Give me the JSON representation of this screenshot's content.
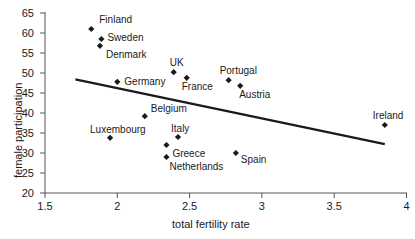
{
  "chart_data": {
    "type": "scatter",
    "title": "",
    "xlabel": "total fertility rate",
    "ylabel": "female participation",
    "xlim": [
      1.5,
      4
    ],
    "ylim": [
      20,
      65
    ],
    "xticks": [
      "1.5",
      "2",
      "2.5",
      "3",
      "3.5",
      "4"
    ],
    "xtick_values": [
      1.5,
      2,
      2.5,
      3,
      3.5,
      4
    ],
    "yticks": [
      "20",
      "25",
      "30",
      "35",
      "40",
      "45",
      "50",
      "55",
      "60",
      "65"
    ],
    "ytick_values": [
      20,
      25,
      30,
      35,
      40,
      45,
      50,
      55,
      60,
      65
    ],
    "grid": false,
    "legend": "none",
    "marker": "diamond",
    "marker_color": "#1a1a1a",
    "line_color": "#1a1a1a",
    "points": [
      {
        "label": "Finland",
        "x": 1.82,
        "y": 61.0,
        "label_dx": 8,
        "label_dy": -14
      },
      {
        "label": "Sweden",
        "x": 1.89,
        "y": 58.5,
        "label_dx": 6,
        "label_dy": -6
      },
      {
        "label": "Denmark",
        "x": 1.88,
        "y": 56.8,
        "label_dx": 6,
        "label_dy": 4
      },
      {
        "label": "UK",
        "x": 2.39,
        "y": 50.2,
        "label_dx": -4,
        "label_dy": -14
      },
      {
        "label": "Germany",
        "x": 2.0,
        "y": 47.8,
        "label_dx": 7,
        "label_dy": -5
      },
      {
        "label": "France",
        "x": 2.48,
        "y": 48.8,
        "label_dx": -5,
        "label_dy": 4
      },
      {
        "label": "Portugal",
        "x": 2.77,
        "y": 48.2,
        "label_dx": -9,
        "label_dy": -14
      },
      {
        "label": "Austria",
        "x": 2.85,
        "y": 46.8,
        "label_dx": -1,
        "label_dy": 4
      },
      {
        "label": "Belgium",
        "x": 2.19,
        "y": 39.2,
        "label_dx": 6,
        "label_dy": -12
      },
      {
        "label": "Ireland",
        "x": 3.85,
        "y": 37.0,
        "label_dx": -12,
        "label_dy": -14
      },
      {
        "label": "Luxembourg",
        "x": 1.95,
        "y": 33.8,
        "label_dx": -20,
        "label_dy": -13
      },
      {
        "label": "Italy",
        "x": 2.42,
        "y": 34.0,
        "label_dx": -7,
        "label_dy": -13
      },
      {
        "label": "Greece",
        "x": 2.34,
        "y": 32.0,
        "label_dx": 6,
        "label_dy": 4
      },
      {
        "label": "Netherlands",
        "x": 2.34,
        "y": 29.0,
        "label_dx": 3,
        "label_dy": 5
      },
      {
        "label": "Spain",
        "x": 2.82,
        "y": 30.0,
        "label_dx": 5,
        "label_dy": 2
      }
    ],
    "trendline": {
      "x_start": 1.71,
      "y_start": 48.4,
      "x_end": 3.85,
      "y_end": 32.2
    }
  }
}
